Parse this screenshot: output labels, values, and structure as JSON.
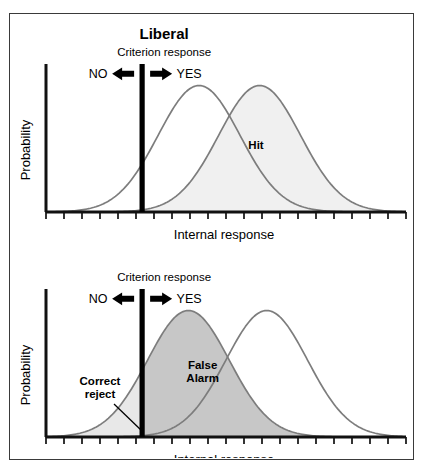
{
  "figure": {
    "title": "Liberal",
    "background": "#ffffff",
    "frame_color": "#3a3a3a"
  },
  "colors": {
    "curve": "#7d7d7d",
    "axis": "#111111",
    "criterion": "#000000",
    "hit_fill": "#f0f0f0",
    "false_alarm_fill": "#c7c7c7",
    "correct_reject_fill": "#e8e8e8",
    "text": "#000000"
  },
  "labels": {
    "criterion_response": "Criterion response",
    "no": "NO",
    "yes": "YES",
    "y_axis": "Probability",
    "x_axis": "Internal response",
    "hit": "Hit",
    "false_alarm_line1": "False",
    "false_alarm_line2": "Alarm",
    "correct_reject_line1": "Correct",
    "correct_reject_line2": "reject"
  },
  "chart_data": {
    "type": "line",
    "title": "Liberal",
    "xlabel": "Internal response",
    "ylabel": "Probability",
    "grid": false,
    "legend": "none",
    "xlim": [
      0,
      100
    ],
    "ylim": [
      0,
      1
    ],
    "axis_ticks": 20,
    "tick_label_values": [],
    "panels": [
      {
        "name": "top-panel",
        "title": "Liberal",
        "criterion_x": 27,
        "shaded_region": "hit",
        "shaded_series": "signal",
        "annotation": "Hit",
        "annotation_x": 59,
        "annotation_y": 0.46,
        "series": [
          {
            "name": "noise",
            "mean": 43,
            "sd": 11.5,
            "peak_height": 0.93,
            "shaded": false
          },
          {
            "name": "signal",
            "mean": 60,
            "sd": 11.5,
            "peak_height": 0.93,
            "shaded": true
          }
        ]
      },
      {
        "name": "bottom-panel",
        "title": "",
        "criterion_x": 27,
        "shaded_region": "false-alarm",
        "shaded_series": "noise",
        "annotation": "False Alarm",
        "annotation_x": 44,
        "annotation_y": 0.5,
        "correct_reject_annotation": "Correct reject",
        "series": [
          {
            "name": "noise",
            "mean": 40,
            "sd": 11.5,
            "peak_height": 0.93,
            "shaded": true
          },
          {
            "name": "signal",
            "mean": 62,
            "sd": 11.5,
            "peak_height": 0.93,
            "shaded": false
          }
        ]
      }
    ]
  }
}
